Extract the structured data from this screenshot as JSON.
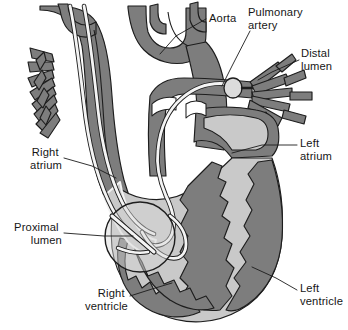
{
  "figure": {
    "kind": "anatomical-illustration",
    "background_color": "#ffffff",
    "palette": {
      "myocardium_and_vessel_wall": "#7d7d7d",
      "blood_cavity": "#c9c9c9",
      "vessel_lumen": "#ffffff",
      "outline": "#1d1d1d",
      "highlight_outline": "#f2f2f2",
      "catheter_outline": "#1e1e1e",
      "catheter_fill": "#f4f4f4",
      "label_text": "#161616"
    }
  },
  "labels": [
    {
      "id": "aorta",
      "text": "Aorta",
      "text_x": 209,
      "text_y": 22,
      "anchor": "start",
      "lines": [
        "Aorta"
      ],
      "leader": "M 206 19 L 176 36 L 160 54"
    },
    {
      "id": "pulmonary-artery",
      "text": "Pulmonary artery",
      "text_x": 248,
      "text_y": 16,
      "anchor": "start",
      "lines": [
        "Pulmonary",
        "artery"
      ],
      "leader": "M 250 31 L 232 66 L 222 86"
    },
    {
      "id": "distal-lumen",
      "text": "Distal lumen",
      "text_x": 301,
      "text_y": 57,
      "anchor": "start",
      "lines": [
        "Distal",
        "lumen"
      ],
      "leader": "M 299 60 L 272 72 L 258 80"
    },
    {
      "id": "left-atrium",
      "text": "Left atrium",
      "text_x": 300,
      "text_y": 147,
      "anchor": "start",
      "lines": [
        "Left",
        "atrium"
      ],
      "leader": "M 297 145 L 262 145 L 232 153"
    },
    {
      "id": "left-ventricle",
      "text": "Left ventricle",
      "text_x": 300,
      "text_y": 292,
      "anchor": "start",
      "lines": [
        "Left",
        "ventricle"
      ],
      "leader": "M 297 290 L 276 278 L 252 267"
    },
    {
      "id": "right-atrium",
      "text": "Right atrium",
      "text_x": 62,
      "text_y": 156,
      "anchor": "end",
      "lines": [
        "Right",
        "atrium"
      ],
      "leader": "M 64 158 L 92 166 L 116 178"
    },
    {
      "id": "proximal-lumen",
      "text": "Proximal lumen",
      "text_x": 62,
      "text_y": 231,
      "anchor": "end",
      "lines": [
        "Proximal",
        "lumen"
      ],
      "leader": "M 64 233 L 104 236 L 133 236"
    },
    {
      "id": "right-ventricle",
      "text": "Right ventricle",
      "text_x": 128,
      "text_y": 297,
      "anchor": "end",
      "lines": [
        "Right",
        "ventricle"
      ],
      "leader": "M 130 296 L 152 289 L 172 283"
    }
  ],
  "structures": {
    "superior_vena_cava": "superior vena cava descending into right atrium",
    "aortic_arch": "aortic arch with brachiocephalic branches",
    "pulmonary_trunk": "pulmonary trunk dividing into right and left pulmonary arteries",
    "right_pulmonary_branches": "branching right pulmonary arterial tree",
    "left_pulmonary_branches": "comb-like left pulmonary vascular tree",
    "right_atrium": "right atrial chamber",
    "right_ventricle": "right ventricular cavity with trabeculated wall",
    "left_atrium": "left atrial chamber",
    "left_ventricle": "left ventricular cavity with thick trabeculated myocardium",
    "interventricular_septum": "jagged interventricular septum",
    "catheter": "pulmonary artery catheter threaded SVC to right atrium to right ventricle to pulmonary artery",
    "balloon_tip": "inflated balloon at catheter tip within right pulmonary artery",
    "proximal_port_inset": "circular magnified inset over right atrium showing proximal lumen port"
  }
}
